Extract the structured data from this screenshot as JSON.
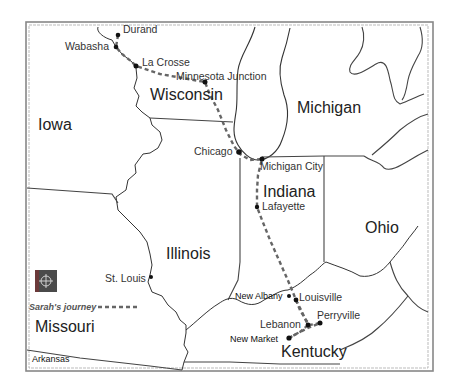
{
  "map": {
    "title": "Sarah's journey map",
    "states": [
      {
        "name": "Iowa",
        "x": 38,
        "y": 130
      },
      {
        "name": "Wisconsin",
        "x": 150,
        "y": 100
      },
      {
        "name": "Michigan",
        "x": 297,
        "y": 113
      },
      {
        "name": "Illinois",
        "x": 166,
        "y": 259
      },
      {
        "name": "Indiana",
        "x": 263,
        "y": 197
      },
      {
        "name": "Ohio",
        "x": 365,
        "y": 233
      },
      {
        "name": "Missouri",
        "x": 35,
        "y": 332
      },
      {
        "name": "Kentucky",
        "x": 281,
        "y": 357
      },
      {
        "name": "Arkansas",
        "x": 32,
        "y": 362
      }
    ],
    "cities": [
      {
        "name": "Durand",
        "label_x": 123,
        "label_y": 33,
        "dot_x": 118,
        "dot_y": 35
      },
      {
        "name": "Wabasha",
        "label_x": 65,
        "label_y": 50,
        "dot_x": 116,
        "dot_y": 47
      },
      {
        "name": "La Crosse",
        "label_x": 142,
        "label_y": 66,
        "dot_x": 136,
        "dot_y": 66
      },
      {
        "name": "Minnesota Junction",
        "label_x": 176,
        "label_y": 80,
        "dot_x": 205,
        "dot_y": 82
      },
      {
        "name": "Chicago",
        "label_x": 194,
        "label_y": 155,
        "dot_x": 239,
        "dot_y": 152
      },
      {
        "name": "Michigan City",
        "label_x": 260,
        "label_y": 170,
        "dot_x": 262,
        "dot_y": 159
      },
      {
        "name": "Lafayette",
        "label_x": 262,
        "label_y": 210,
        "dot_x": 257,
        "dot_y": 207
      },
      {
        "name": "St. Louis",
        "label_x": 105,
        "label_y": 282,
        "dot_x": 151,
        "dot_y": 277
      },
      {
        "name": "New Albany",
        "label_x": 235,
        "label_y": 299,
        "dot_x": 289,
        "dot_y": 296
      },
      {
        "name": "Louisville",
        "label_x": 299,
        "label_y": 301,
        "dot_x": 296,
        "dot_y": 300
      },
      {
        "name": "Perryville",
        "label_x": 317,
        "label_y": 319,
        "dot_x": 320,
        "dot_y": 323
      },
      {
        "name": "Lebanon",
        "label_x": 260,
        "label_y": 328,
        "dot_x": 308,
        "dot_y": 325
      },
      {
        "name": "New Market",
        "label_x": 230,
        "label_y": 342,
        "dot_x": 289,
        "dot_y": 338
      }
    ],
    "legend": {
      "route_label": "Sarah's journey",
      "compass_icon": "compass-rose-icon"
    },
    "colors": {
      "route": "#666666",
      "border": "#444444",
      "compass_bg": "#4a4a4a",
      "compass_accent": "#6b3a3a"
    }
  }
}
